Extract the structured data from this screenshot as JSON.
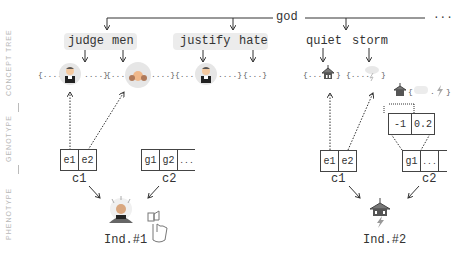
{
  "side_labels": [
    "CONCEPT TREE",
    "GENOTYPE",
    "PHENOTYPE"
  ],
  "root": {
    "label": "god",
    "ellipsis": "..."
  },
  "concepts": {
    "left": {
      "words": [
        "judge",
        "men",
        "justify",
        "hate"
      ]
    },
    "right": {
      "words": [
        "quiet",
        "storm"
      ]
    }
  },
  "sets": {
    "judge_open": "{....",
    "judge_close": "....}",
    "men_open": "{....",
    "men_close": "....}",
    "justify_open": "{....",
    "justify_close": "....}",
    "hate": "{...}",
    "quiet_open": "{....",
    "quiet_close": "}",
    "storm_open": "{....",
    "storm_close": "}",
    "blend_open": "{",
    "blend_mid": ".",
    "blend_close": "}"
  },
  "genotype": {
    "ind1": {
      "c1": {
        "label": "c1",
        "cells": [
          "e1",
          "e2"
        ]
      },
      "c2": {
        "label": "c2",
        "cells": [
          "g1",
          "g2",
          "..."
        ]
      }
    },
    "ind2": {
      "c1": {
        "label": "c1",
        "cells": [
          "e1",
          "e2"
        ]
      },
      "c2": {
        "label": "c2",
        "cells": [
          "g1",
          "..."
        ]
      },
      "weights": [
        "-1",
        "0.2"
      ]
    }
  },
  "phenotype": {
    "ind1": {
      "label": "Ind.#1"
    },
    "ind2": {
      "label": "Ind.#2"
    }
  },
  "icons": [
    "judge-emoji-icon",
    "men-emoji-icon",
    "thumbs-up-hand-icon",
    "temple-icon",
    "lightning-icon"
  ],
  "colors": {
    "line": "#333333",
    "side_label": "#b8b8b8",
    "word_bg": "#ececec",
    "icon_bg": "#e6e6e6"
  }
}
